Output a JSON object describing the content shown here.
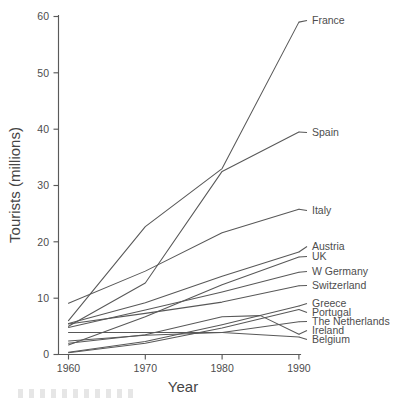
{
  "chart_data": {
    "type": "line",
    "title": "",
    "xlabel": "Year",
    "ylabel": "Tourists (millions)",
    "xlim": [
      1960,
      1990
    ],
    "ylim": [
      0,
      60
    ],
    "xticks": [
      1960,
      1970,
      1980,
      1990
    ],
    "yticks": [
      0,
      10,
      20,
      30,
      40,
      50,
      60
    ],
    "grid": false,
    "legend_position": "right-inline-labels",
    "line_color": "#585858",
    "background_color": "#ffffff",
    "x": [
      1960,
      1970,
      1980,
      1990
    ],
    "series": [
      {
        "name": "France",
        "label": "France",
        "values": [
          6.0,
          22.7,
          33.0,
          59.0
        ]
      },
      {
        "name": "Spain",
        "label": "Spain",
        "values": [
          5.0,
          12.7,
          32.5,
          39.5
        ]
      },
      {
        "name": "Italy",
        "label": "Italy",
        "values": [
          9.1,
          14.8,
          21.6,
          25.8
        ]
      },
      {
        "name": "Austria",
        "label": "Austria",
        "values": [
          5.5,
          9.2,
          13.9,
          18.2
        ]
      },
      {
        "name": "UK",
        "label": "UK",
        "values": [
          1.7,
          6.7,
          12.4,
          17.3
        ]
      },
      {
        "name": "W Germany",
        "label": "W Germany",
        "values": [
          4.8,
          7.9,
          11.1,
          14.6
        ]
      },
      {
        "name": "Switzerland",
        "label": "Switzerland",
        "values": [
          5.4,
          7.3,
          9.3,
          12.2
        ]
      },
      {
        "name": "Greece",
        "label": "Greece",
        "values": [
          0.4,
          2.3,
          5.3,
          8.6
        ]
      },
      {
        "name": "Portugal",
        "label": "Portugal",
        "values": [
          0.3,
          2.0,
          4.7,
          8.0
        ]
      },
      {
        "name": "The Netherlands",
        "label": "The Netherlands",
        "values": [
          2.4,
          3.4,
          3.9,
          5.8
        ]
      },
      {
        "name": "Ireland",
        "label": "Ireland",
        "values": [
          2.0,
          3.5,
          6.7,
          3.6
        ]
      },
      {
        "name": "Belgium",
        "label": "Belgium",
        "values": [
          3.9,
          3.9,
          3.9,
          3.1
        ]
      }
    ]
  }
}
